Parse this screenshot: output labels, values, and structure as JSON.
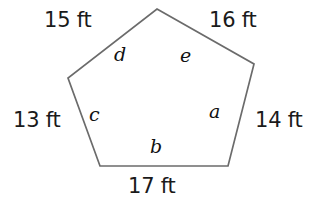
{
  "figure": {
    "kind": "irregular-pentagon-diagram",
    "background_color": "#ffffff",
    "stroke_color": "#6b6b6b",
    "stroke_width": 1.7,
    "fill_color": "none",
    "vertices": [
      {
        "name": "apex",
        "x": 157,
        "y": 9
      },
      {
        "name": "right",
        "x": 254,
        "y": 64
      },
      {
        "name": "bottom-right",
        "x": 228,
        "y": 166
      },
      {
        "name": "bottom-left",
        "x": 100,
        "y": 166
      },
      {
        "name": "left",
        "x": 68,
        "y": 78
      }
    ],
    "path": "M 157 9 L 254 64 L 228 166 L 100 166 L 68 78 Z"
  },
  "side_labels": [
    {
      "id": "top-left",
      "text": "15 ft",
      "between": [
        "left",
        "apex"
      ],
      "color": "#1a1a1a"
    },
    {
      "id": "top-right",
      "text": "16 ft",
      "between": [
        "apex",
        "right"
      ],
      "color": "#1a1a1a"
    },
    {
      "id": "left",
      "text": "13 ft",
      "between": [
        "left",
        "bottom-left"
      ],
      "color": "#1a1a1a"
    },
    {
      "id": "right",
      "text": "14 ft",
      "between": [
        "right",
        "bottom-right"
      ],
      "color": "#1a1a1a"
    },
    {
      "id": "bottom",
      "text": "17 ft",
      "between": [
        "bottom-left",
        "bottom-right"
      ],
      "color": "#1a1a1a"
    }
  ],
  "angle_labels": [
    {
      "id": "a",
      "text": "a",
      "at_vertex": "bottom-right",
      "color": "#111111"
    },
    {
      "id": "b",
      "text": "b",
      "at_vertex": "bottom-edge",
      "color": "#111111"
    },
    {
      "id": "c",
      "text": "c",
      "at_vertex": "left",
      "color": "#111111"
    },
    {
      "id": "d",
      "text": "d",
      "at_vertex": "apex-left",
      "color": "#111111"
    },
    {
      "id": "e",
      "text": "e",
      "at_vertex": "apex-right",
      "color": "#111111"
    }
  ],
  "units": "ft"
}
